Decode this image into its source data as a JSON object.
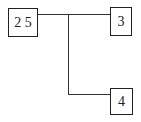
{
  "diagram": {
    "type": "tree",
    "nodes": [
      {
        "id": "root",
        "label": "2 5"
      },
      {
        "id": "child1",
        "label": "3"
      },
      {
        "id": "child2",
        "label": "4"
      }
    ],
    "edges": [
      {
        "from": "root",
        "to": "child1"
      },
      {
        "from": "root",
        "to": "child2"
      }
    ]
  }
}
